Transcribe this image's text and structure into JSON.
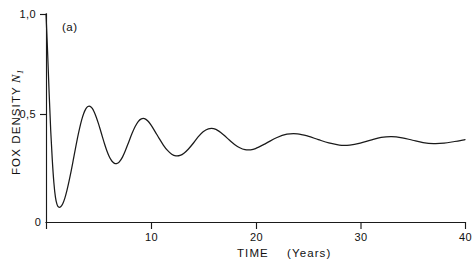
{
  "figure": {
    "panel_label": "(a)",
    "background_color": "#ffffff",
    "line_color": "#1a1a1a"
  },
  "chart_data": {
    "type": "line",
    "title": "",
    "subtitle": "",
    "panel": "(a)",
    "xlabel": "TIME   (Years)",
    "xlabel_main": "TIME",
    "xlabel_unit": "(Years)",
    "ylabel": "FOX DENSITY N1",
    "ylabel_main": "FOX  DENSITY",
    "ylabel_symbol": "N",
    "ylabel_subscript": "1",
    "xlim": [
      0,
      40
    ],
    "ylim": [
      0,
      1.0
    ],
    "xticks": [
      0,
      10,
      20,
      30,
      40
    ],
    "xticklabels": [
      "0",
      "10",
      "20",
      "30",
      "40"
    ],
    "yticks": [
      0.5,
      1.0
    ],
    "yticklabels": [
      "0,5",
      "1,0"
    ],
    "grid": false,
    "legend": "none",
    "series": [
      {
        "name": "Fox density N1",
        "description": "Damped oscillation converging to steady state",
        "equilibrium": 0.36,
        "initial_value": 1.0,
        "period_years": 4.2,
        "x": [
          0.0,
          0.15,
          0.3,
          0.45,
          0.6,
          0.75,
          0.9,
          1.05,
          1.2,
          1.4,
          1.6,
          1.8,
          2.0,
          2.2,
          2.4,
          2.6,
          2.8,
          3.0,
          3.2,
          3.4,
          3.6,
          3.8,
          4.0,
          4.2,
          4.4,
          4.6,
          4.8,
          5.0,
          5.2,
          5.4,
          5.6,
          5.8,
          6.0,
          6.2,
          6.4,
          6.6,
          6.8,
          7.0,
          7.3,
          7.6,
          7.9,
          8.2,
          8.5,
          8.8,
          9.1,
          9.4,
          9.7,
          10.0,
          10.4,
          10.8,
          11.2,
          11.6,
          12.0,
          12.4,
          12.8,
          13.2,
          13.6,
          14.0,
          14.5,
          15.0,
          15.5,
          16.0,
          16.5,
          17.0,
          17.5,
          18.0,
          18.5,
          19.0,
          19.5,
          20.0,
          21.0,
          22.0,
          23.0,
          24.0,
          25.0,
          26.0,
          27.0,
          28.0,
          29.0,
          30.0,
          31.0,
          32.0,
          33.0,
          34.0,
          35.0,
          36.0,
          37.0,
          38.0,
          39.0,
          40.0
        ],
        "y": [
          1.0,
          0.82,
          0.62,
          0.44,
          0.3,
          0.19,
          0.12,
          0.085,
          0.072,
          0.073,
          0.088,
          0.115,
          0.152,
          0.196,
          0.245,
          0.297,
          0.35,
          0.402,
          0.449,
          0.49,
          0.522,
          0.544,
          0.555,
          0.556,
          0.547,
          0.529,
          0.504,
          0.474,
          0.441,
          0.407,
          0.374,
          0.344,
          0.319,
          0.3,
          0.287,
          0.281,
          0.282,
          0.289,
          0.312,
          0.346,
          0.385,
          0.424,
          0.458,
          0.483,
          0.496,
          0.497,
          0.487,
          0.468,
          0.436,
          0.402,
          0.37,
          0.344,
          0.326,
          0.318,
          0.32,
          0.332,
          0.351,
          0.375,
          0.408,
          0.434,
          0.448,
          0.449,
          0.437,
          0.417,
          0.394,
          0.373,
          0.357,
          0.348,
          0.347,
          0.353,
          0.378,
          0.405,
          0.422,
          0.424,
          0.413,
          0.396,
          0.38,
          0.37,
          0.37,
          0.379,
          0.394,
          0.407,
          0.411,
          0.405,
          0.393,
          0.382,
          0.377,
          0.379,
          0.387,
          0.396
        ]
      }
    ]
  },
  "axis_geometry": {
    "origin_x_px": 46,
    "origin_y_px": 222,
    "x_end_px": 465,
    "y_top_px": 14
  }
}
